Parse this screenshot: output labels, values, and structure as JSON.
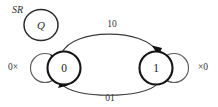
{
  "diagram": {
    "title_label": "SR",
    "output_node": {
      "label": "Q"
    },
    "states": [
      {
        "id": "s0",
        "label": "0"
      },
      {
        "id": "s1",
        "label": "1"
      }
    ],
    "self_loops": [
      {
        "id": "loop-s0",
        "label": "0×",
        "state": "0"
      },
      {
        "id": "loop-s1",
        "label": "×0",
        "state": "1"
      }
    ],
    "transitions": [
      {
        "id": "t-0-to-1",
        "label": "10",
        "from": "0",
        "to": "1",
        "position": "top"
      },
      {
        "id": "t-1-to-0",
        "label": "01",
        "from": "1",
        "to": "0",
        "position": "bottom"
      }
    ],
    "colors": {
      "node_stroke": "#141414",
      "loop_stroke": "#5d5d5d",
      "arc_stroke": "#3a3a3a",
      "text": "#2a2a2a",
      "background": "#ffffff"
    }
  }
}
